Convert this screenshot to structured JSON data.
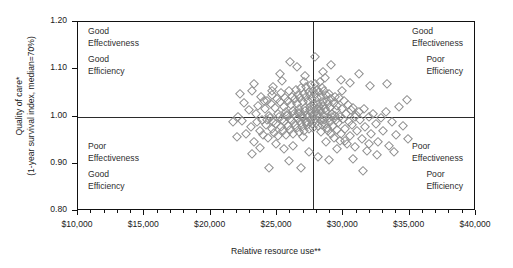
{
  "chart_data": {
    "type": "scatter",
    "title": "",
    "xlabel": "Relative resource use**",
    "ylabel_line1": "Quality of care*",
    "ylabel_line2": "(1-year survival index, median=70%)",
    "xlim": [
      10000,
      40000
    ],
    "ylim": [
      0.8,
      1.2
    ],
    "xticks": [
      10000,
      15000,
      20000,
      25000,
      30000,
      35000,
      40000
    ],
    "xtick_labels": [
      "$10,000",
      "$15,000",
      "$20,000",
      "$25,000",
      "$30,000",
      "$35,000",
      "$40,000"
    ],
    "xtick_minor_step": 1000,
    "yticks": [
      0.8,
      0.9,
      1.0,
      1.1,
      1.2
    ],
    "ytick_labels": [
      "0.80",
      "0.90",
      "1.00",
      "1.10",
      "1.20"
    ],
    "grid": false,
    "legend": null,
    "reference_lines": {
      "horizontal_y": 1.0,
      "vertical_x": 27700
    },
    "quadrant_annotations": [
      {
        "position": "top-left",
        "line1": "Good",
        "line2": "Effectiveness",
        "line3": "Good",
        "line4": "Efficiency"
      },
      {
        "position": "top-right",
        "line1": "Good",
        "line2": "Effectiveness",
        "line3": "Poor",
        "line4": "Efficiency"
      },
      {
        "position": "bottom-left",
        "line1": "Poor",
        "line2": "Effectiveness",
        "line3": "Good",
        "line4": "Efficiency"
      },
      {
        "position": "bottom-right",
        "line1": "Poor",
        "line2": "Effectiveness",
        "line3": "Poor",
        "line4": "Efficiency"
      }
    ],
    "marker": {
      "shape": "diamond-open",
      "edge_color": "#8c8c8c",
      "size_px": 5.2
    },
    "points": [
      [
        22050,
        1.0
      ],
      [
        22380,
        0.99
      ],
      [
        22550,
        1.029
      ],
      [
        22700,
        0.962
      ],
      [
        22900,
        1.013
      ],
      [
        23050,
        0.978
      ],
      [
        23150,
        1.053
      ],
      [
        23250,
        0.945
      ],
      [
        23400,
        1.005
      ],
      [
        23500,
        0.988
      ],
      [
        23600,
        1.023
      ],
      [
        23700,
        0.97
      ],
      [
        23800,
        1.041
      ],
      [
        23900,
        0.993
      ],
      [
        23980,
        0.96
      ],
      [
        24080,
        1.015
      ],
      [
        24150,
        0.982
      ],
      [
        24230,
        1.033
      ],
      [
        24300,
        0.954
      ],
      [
        24380,
        1.002
      ],
      [
        24450,
        0.996
      ],
      [
        24520,
        1.026
      ],
      [
        24600,
        0.974
      ],
      [
        24660,
        1.046
      ],
      [
        24720,
        0.989
      ],
      [
        24790,
        0.966
      ],
      [
        24860,
        1.018
      ],
      [
        24920,
        0.985
      ],
      [
        24980,
        1.036
      ],
      [
        25040,
        0.958
      ],
      [
        25100,
        1.006
      ],
      [
        25160,
        0.999
      ],
      [
        25220,
        1.03
      ],
      [
        25280,
        0.977
      ],
      [
        25330,
        1.05
      ],
      [
        25390,
        0.992
      ],
      [
        25440,
        0.969
      ],
      [
        25500,
        1.021
      ],
      [
        25550,
        0.988
      ],
      [
        25610,
        1.039
      ],
      [
        25660,
        0.961
      ],
      [
        25710,
        1.009
      ],
      [
        25760,
        1.002
      ],
      [
        25810,
        1.033
      ],
      [
        25860,
        0.98
      ],
      [
        25910,
        1.054
      ],
      [
        25960,
        0.995
      ],
      [
        26000,
        0.972
      ],
      [
        26050,
        1.024
      ],
      [
        26100,
        0.991
      ],
      [
        26140,
        1.042
      ],
      [
        26190,
        0.964
      ],
      [
        26230,
        1.012
      ],
      [
        26280,
        1.005
      ],
      [
        26320,
        1.036
      ],
      [
        26360,
        0.983
      ],
      [
        26400,
        1.057
      ],
      [
        26440,
        0.998
      ],
      [
        26490,
        0.975
      ],
      [
        26530,
        1.027
      ],
      [
        26570,
        0.994
      ],
      [
        26610,
        1.045
      ],
      [
        26650,
        0.967
      ],
      [
        26690,
        1.015
      ],
      [
        26720,
        1.008
      ],
      [
        26760,
        1.039
      ],
      [
        26800,
        0.986
      ],
      [
        26840,
        1.06
      ],
      [
        26870,
        1.001
      ],
      [
        26910,
        0.978
      ],
      [
        26950,
        1.03
      ],
      [
        26980,
        0.997
      ],
      [
        27020,
        1.048
      ],
      [
        27050,
        0.97
      ],
      [
        27090,
        1.018
      ],
      [
        27120,
        1.011
      ],
      [
        27160,
        1.042
      ],
      [
        27190,
        0.989
      ],
      [
        27220,
        1.063
      ],
      [
        27260,
        1.004
      ],
      [
        27290,
        0.981
      ],
      [
        27320,
        1.033
      ],
      [
        27350,
        1.0
      ],
      [
        27390,
        1.051
      ],
      [
        27420,
        0.973
      ],
      [
        27450,
        1.021
      ],
      [
        27480,
        1.014
      ],
      [
        27510,
        1.045
      ],
      [
        27540,
        0.992
      ],
      [
        27570,
        1.066
      ],
      [
        27600,
        1.007
      ],
      [
        27630,
        0.984
      ],
      [
        27660,
        1.036
      ],
      [
        27690,
        1.003
      ],
      [
        27700,
        1.0
      ],
      [
        27720,
        1.054
      ],
      [
        27750,
        0.976
      ],
      [
        27780,
        1.024
      ],
      [
        27810,
        1.017
      ],
      [
        27840,
        1.048
      ],
      [
        27870,
        0.995
      ],
      [
        27900,
        1.069
      ],
      [
        27930,
        1.01
      ],
      [
        27960,
        0.987
      ],
      [
        27990,
        1.039
      ],
      [
        28020,
        1.006
      ],
      [
        28050,
        1.057
      ],
      [
        28080,
        0.979
      ],
      [
        28110,
        1.027
      ],
      [
        28140,
        1.02
      ],
      [
        28170,
        1.051
      ],
      [
        28200,
        0.998
      ],
      [
        28230,
        1.072
      ],
      [
        28260,
        1.013
      ],
      [
        28290,
        0.99
      ],
      [
        28320,
        1.042
      ],
      [
        28350,
        1.009
      ],
      [
        28390,
        1.06
      ],
      [
        28420,
        0.982
      ],
      [
        28450,
        1.03
      ],
      [
        28480,
        1.023
      ],
      [
        28510,
        1.054
      ],
      [
        28550,
        1.001
      ],
      [
        28580,
        0.993
      ],
      [
        28610,
        1.016
      ],
      [
        28650,
        0.985
      ],
      [
        28680,
        1.045
      ],
      [
        28720,
        1.012
      ],
      [
        28750,
        0.976
      ],
      [
        28790,
        1.033
      ],
      [
        28820,
        0.969
      ],
      [
        28860,
        1.026
      ],
      [
        28900,
        0.996
      ],
      [
        28940,
        1.048
      ],
      [
        28980,
        0.988
      ],
      [
        29020,
        1.019
      ],
      [
        29060,
        0.962
      ],
      [
        29100,
        1.036
      ],
      [
        29140,
        0.999
      ],
      [
        29180,
        1.006
      ],
      [
        29230,
        0.979
      ],
      [
        29270,
        1.029
      ],
      [
        29320,
        0.955
      ],
      [
        29360,
        1.042
      ],
      [
        29410,
        0.992
      ],
      [
        29460,
        1.013
      ],
      [
        29510,
        0.971
      ],
      [
        29560,
        1.022
      ],
      [
        29610,
        0.986
      ],
      [
        29670,
        1.039
      ],
      [
        29720,
        0.948
      ],
      [
        29780,
        1.0
      ],
      [
        29840,
        0.964
      ],
      [
        29900,
        1.016
      ],
      [
        29960,
        0.995
      ],
      [
        30030,
        1.032
      ],
      [
        30100,
        0.974
      ],
      [
        30170,
        1.006
      ],
      [
        30240,
        0.942
      ],
      [
        30320,
        1.025
      ],
      [
        30400,
        0.989
      ],
      [
        30480,
        0.958
      ],
      [
        30570,
        1.013
      ],
      [
        30660,
        0.982
      ],
      [
        30750,
        1.019
      ],
      [
        30850,
        0.935
      ],
      [
        30950,
        1.003
      ],
      [
        31060,
        0.969
      ],
      [
        31170,
        1.009
      ],
      [
        31290,
        0.993
      ],
      [
        31410,
        0.953
      ],
      [
        31540,
        1.016
      ],
      [
        31670,
        0.977
      ],
      [
        31810,
        0.928
      ],
      [
        31960,
        1.0
      ],
      [
        32110,
        0.962
      ],
      [
        32270,
        1.006
      ],
      [
        32440,
        0.985
      ],
      [
        32620,
        0.945
      ],
      [
        32810,
        0.996
      ],
      [
        33010,
        0.97
      ],
      [
        33220,
        1.01
      ],
      [
        33450,
        0.938
      ],
      [
        33690,
        0.989
      ],
      [
        33950,
        0.96
      ],
      [
        34230,
        1.02
      ],
      [
        34500,
        0.98
      ],
      [
        23250,
        1.068
      ],
      [
        24050,
        1.032
      ],
      [
        24600,
        1.055
      ],
      [
        25200,
        1.09
      ],
      [
        26000,
        1.115
      ],
      [
        26500,
        1.105
      ],
      [
        27100,
        1.085
      ],
      [
        27900,
        1.125
      ],
      [
        28500,
        1.095
      ],
      [
        29100,
        1.108
      ],
      [
        29800,
        1.078
      ],
      [
        30500,
        1.07
      ],
      [
        31200,
        1.09
      ],
      [
        32000,
        1.065
      ],
      [
        33300,
        1.068
      ],
      [
        34800,
        1.035
      ],
      [
        21700,
        0.988
      ],
      [
        22200,
        1.048
      ],
      [
        22000,
        0.956
      ],
      [
        23100,
        0.92
      ],
      [
        24400,
        0.89
      ],
      [
        25900,
        0.905
      ],
      [
        26800,
        0.892
      ],
      [
        28100,
        0.915
      ],
      [
        28900,
        0.908
      ],
      [
        29500,
        0.932
      ],
      [
        30700,
        0.91
      ],
      [
        31500,
        0.885
      ],
      [
        32500,
        0.918
      ],
      [
        33800,
        0.925
      ],
      [
        34900,
        0.952
      ],
      [
        25500,
        0.931
      ],
      [
        26200,
        0.938
      ],
      [
        27400,
        0.925
      ],
      [
        28700,
        0.946
      ],
      [
        24900,
        0.942
      ],
      [
        23700,
        0.934
      ],
      [
        30100,
        0.948
      ],
      [
        31900,
        0.942
      ],
      [
        26600,
        1.008
      ],
      [
        27250,
        0.989
      ],
      [
        28050,
        1.015
      ],
      [
        25750,
        1.004
      ],
      [
        29350,
        1.002
      ],
      [
        24250,
        0.992
      ],
      [
        30900,
        0.998
      ],
      [
        26950,
        0.956
      ],
      [
        28350,
        0.968
      ],
      [
        27050,
        1.074
      ],
      [
        28650,
        1.082
      ],
      [
        25400,
        1.076
      ],
      [
        29900,
        1.055
      ],
      [
        24700,
        1.062
      ]
    ]
  }
}
